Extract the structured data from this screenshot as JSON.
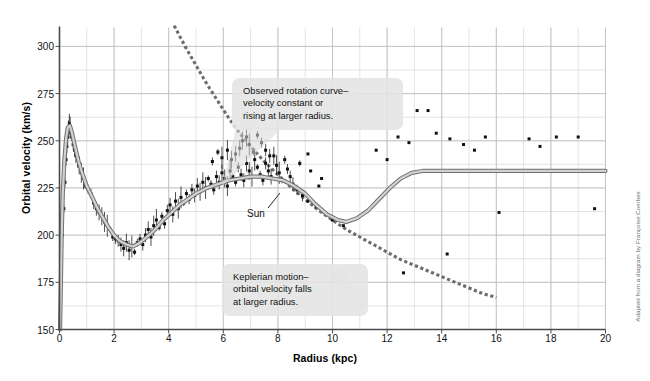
{
  "chart_data": {
    "type": "scatter",
    "title": "",
    "xlabel": "Radius (kpc)",
    "ylabel": "Orbital velocity (km/s)",
    "xlim": [
      0,
      20
    ],
    "ylim": [
      150,
      310
    ],
    "xticks": [
      0,
      2,
      4,
      6,
      8,
      10,
      12,
      14,
      16,
      18,
      20
    ],
    "yticks": [
      150,
      175,
      200,
      225,
      250,
      275,
      300
    ],
    "grid": true,
    "grid_minor_x_step": 1,
    "grid_minor_y_step": 12.5,
    "legend_position": "none",
    "series": [
      {
        "name": "Observed rotation curve (model)",
        "type": "line",
        "style": "solid",
        "color": "#8a8a8a",
        "points": [
          [
            0.02,
            150
          ],
          [
            0.05,
            175
          ],
          [
            0.08,
            200
          ],
          [
            0.12,
            222
          ],
          [
            0.18,
            240
          ],
          [
            0.24,
            251
          ],
          [
            0.3,
            257
          ],
          [
            0.38,
            258
          ],
          [
            0.46,
            254
          ],
          [
            0.55,
            248
          ],
          [
            0.7,
            239
          ],
          [
            0.85,
            232
          ],
          [
            1.0,
            226
          ],
          [
            1.2,
            220
          ],
          [
            1.4,
            214
          ],
          [
            1.6,
            209
          ],
          [
            1.8,
            204
          ],
          [
            2.0,
            200
          ],
          [
            2.2,
            197
          ],
          [
            2.45,
            195
          ],
          [
            2.7,
            194
          ],
          [
            2.95,
            196
          ],
          [
            3.2,
            199
          ],
          [
            3.5,
            203
          ],
          [
            3.8,
            208
          ],
          [
            4.1,
            212
          ],
          [
            4.4,
            216
          ],
          [
            4.7,
            219
          ],
          [
            5.0,
            222
          ],
          [
            5.4,
            225
          ],
          [
            5.8,
            227
          ],
          [
            6.2,
            229
          ],
          [
            6.6,
            230
          ],
          [
            7.0,
            231
          ],
          [
            7.4,
            231
          ],
          [
            7.8,
            230
          ],
          [
            8.2,
            229
          ],
          [
            8.6,
            226
          ],
          [
            9.0,
            222
          ],
          [
            9.4,
            216
          ],
          [
            9.8,
            211
          ],
          [
            10.2,
            208
          ],
          [
            10.5,
            207
          ],
          [
            10.9,
            209
          ],
          [
            11.3,
            213
          ],
          [
            11.7,
            219
          ],
          [
            12.1,
            225
          ],
          [
            12.5,
            230
          ],
          [
            12.9,
            233
          ],
          [
            13.3,
            234
          ],
          [
            14.0,
            234
          ],
          [
            16.0,
            234
          ],
          [
            18.0,
            234
          ],
          [
            20.0,
            234
          ]
        ]
      },
      {
        "name": "Keplerian motion",
        "type": "line",
        "style": "dashed",
        "color": "#6d6d6d",
        "points": [
          [
            4.2,
            311
          ],
          [
            4.6,
            300
          ],
          [
            5.0,
            290
          ],
          [
            5.4,
            280
          ],
          [
            5.8,
            271
          ],
          [
            6.2,
            262
          ],
          [
            6.6,
            254
          ],
          [
            7.0,
            247
          ],
          [
            7.5,
            239
          ],
          [
            8.0,
            232
          ],
          [
            8.5,
            225
          ],
          [
            9.0,
            219
          ],
          [
            9.5,
            213
          ],
          [
            10.0,
            208
          ],
          [
            10.5,
            203
          ],
          [
            11.0,
            199
          ],
          [
            11.5,
            195
          ],
          [
            12.0,
            191
          ],
          [
            12.5,
            187
          ],
          [
            13.0,
            184
          ],
          [
            13.5,
            181
          ],
          [
            14.0,
            178
          ],
          [
            14.5,
            175
          ],
          [
            15.0,
            172
          ],
          [
            15.5,
            169
          ],
          [
            16.0,
            167
          ]
        ]
      },
      {
        "name": "Observed data points",
        "type": "scatter",
        "color": "#111111",
        "points": [
          [
            0.1,
            200
          ],
          [
            0.16,
            214
          ],
          [
            0.2,
            228
          ],
          [
            0.24,
            240
          ],
          [
            0.27,
            247
          ],
          [
            0.3,
            252
          ],
          [
            0.33,
            256
          ],
          [
            0.36,
            259
          ],
          [
            0.39,
            257
          ],
          [
            0.42,
            254
          ],
          [
            0.45,
            252
          ],
          [
            0.5,
            248
          ],
          [
            0.55,
            245
          ],
          [
            0.6,
            242
          ],
          [
            0.66,
            240
          ],
          [
            0.72,
            237
          ],
          [
            0.8,
            233
          ],
          [
            0.88,
            230
          ],
          [
            0.96,
            226
          ],
          [
            1.05,
            224
          ],
          [
            1.15,
            222
          ],
          [
            1.25,
            217
          ],
          [
            1.35,
            214
          ],
          [
            1.45,
            212
          ],
          [
            1.55,
            210
          ],
          [
            1.65,
            207
          ],
          [
            1.75,
            205
          ],
          [
            1.85,
            203
          ],
          [
            1.95,
            199
          ],
          [
            2.05,
            198
          ],
          [
            2.15,
            197
          ],
          [
            2.25,
            195
          ],
          [
            2.35,
            193
          ],
          [
            2.45,
            196
          ],
          [
            2.55,
            192
          ],
          [
            2.65,
            194
          ],
          [
            2.75,
            191
          ],
          [
            2.85,
            196
          ],
          [
            2.95,
            198
          ],
          [
            3.05,
            195
          ],
          [
            3.15,
            200
          ],
          [
            3.25,
            203
          ],
          [
            3.35,
            199
          ],
          [
            3.45,
            205
          ],
          [
            3.55,
            208
          ],
          [
            3.65,
            204
          ],
          [
            3.75,
            210
          ],
          [
            3.85,
            206
          ],
          [
            3.95,
            213
          ],
          [
            4.05,
            216
          ],
          [
            4.15,
            211
          ],
          [
            4.25,
            218
          ],
          [
            4.35,
            214
          ],
          [
            4.45,
            220
          ],
          [
            4.55,
            217
          ],
          [
            4.65,
            222
          ],
          [
            4.75,
            219
          ],
          [
            4.85,
            224
          ],
          [
            4.95,
            221
          ],
          [
            5.05,
            226
          ],
          [
            5.15,
            223
          ],
          [
            5.25,
            228
          ],
          [
            5.35,
            225
          ],
          [
            5.45,
            230
          ],
          [
            5.55,
            227
          ],
          [
            5.65,
            224
          ],
          [
            5.75,
            231
          ],
          [
            5.85,
            228
          ],
          [
            5.95,
            233
          ],
          [
            6.05,
            230
          ],
          [
            6.15,
            226
          ],
          [
            6.25,
            234
          ],
          [
            6.35,
            231
          ],
          [
            6.45,
            228
          ],
          [
            6.55,
            236
          ],
          [
            6.65,
            232
          ],
          [
            6.75,
            229
          ],
          [
            6.85,
            238
          ],
          [
            6.95,
            234
          ],
          [
            7.05,
            231
          ],
          [
            7.15,
            240
          ],
          [
            7.25,
            236
          ],
          [
            7.35,
            232
          ],
          [
            7.45,
            229
          ],
          [
            7.55,
            238
          ],
          [
            7.65,
            234
          ],
          [
            7.75,
            231
          ],
          [
            7.85,
            242
          ],
          [
            7.95,
            237
          ],
          [
            8.05,
            233
          ],
          [
            8.15,
            229
          ],
          [
            8.25,
            240
          ],
          [
            8.35,
            235
          ],
          [
            8.45,
            231
          ],
          [
            8.55,
            227
          ],
          [
            6.6,
            246
          ],
          [
            6.7,
            250
          ],
          [
            6.85,
            252
          ],
          [
            6.95,
            248
          ],
          [
            7.1,
            244
          ],
          [
            7.25,
            253
          ],
          [
            7.4,
            249
          ],
          [
            7.55,
            245
          ],
          [
            7.7,
            242
          ],
          [
            6.45,
            243
          ],
          [
            6.3,
            240
          ],
          [
            6.15,
            245
          ],
          [
            5.95,
            241
          ],
          [
            5.8,
            244
          ],
          [
            5.6,
            239
          ],
          [
            8.7,
            224
          ],
          [
            8.9,
            221
          ],
          [
            9.1,
            218
          ],
          [
            9.4,
            215
          ],
          [
            9.7,
            212
          ],
          [
            10.0,
            208
          ],
          [
            10.4,
            205
          ],
          [
            8.8,
            238
          ],
          [
            9.2,
            234
          ],
          [
            9.6,
            230
          ],
          [
            9.1,
            243
          ],
          [
            9.5,
            226
          ],
          [
            12.4,
            252
          ],
          [
            12.8,
            249
          ],
          [
            13.1,
            266
          ],
          [
            13.5,
            266
          ],
          [
            13.8,
            254
          ],
          [
            14.3,
            251
          ],
          [
            14.8,
            248
          ],
          [
            15.2,
            245
          ],
          [
            15.6,
            252
          ],
          [
            16.1,
            212
          ],
          [
            17.2,
            251
          ],
          [
            17.6,
            247
          ],
          [
            18.2,
            252
          ],
          [
            19.0,
            252
          ],
          [
            19.6,
            214
          ],
          [
            11.6,
            245
          ],
          [
            12.0,
            240
          ],
          [
            14.2,
            190
          ],
          [
            12.6,
            180
          ]
        ]
      }
    ],
    "annotations": [
      {
        "id": "observed",
        "lines": [
          "Observed rotation curve–",
          "velocity constant or",
          "rising at larger radius."
        ]
      },
      {
        "id": "kepler",
        "lines": [
          "Keplerian motion–",
          "orbital velocity falls",
          "at larger radius."
        ]
      },
      {
        "id": "sun",
        "text": "Sun"
      }
    ],
    "credit": "Adapted from a diagram by Françoise Combes",
    "colors": {
      "curve": "#8a8a8a",
      "dashed": "#6d6d6d",
      "points": "#111111",
      "grid_minor": "#d9d9d9",
      "grid_major": "#bdbdbd",
      "axis": "#4a4a4a",
      "callout_bg": "#e4e4e4"
    }
  }
}
